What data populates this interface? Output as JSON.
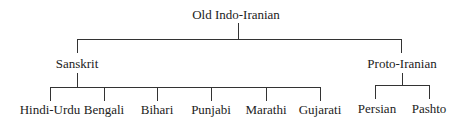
{
  "tree": {
    "root": {
      "label": "Old Indo-Iranian"
    },
    "branches": [
      {
        "label": "Sanskrit",
        "children": [
          "Hindi-Urdu",
          "Bengali",
          "Bihari",
          "Punjabi",
          "Marathi",
          "Gujarati"
        ]
      },
      {
        "label": "Proto-Iranian",
        "children": [
          "Persian",
          "Pashto"
        ]
      }
    ]
  }
}
